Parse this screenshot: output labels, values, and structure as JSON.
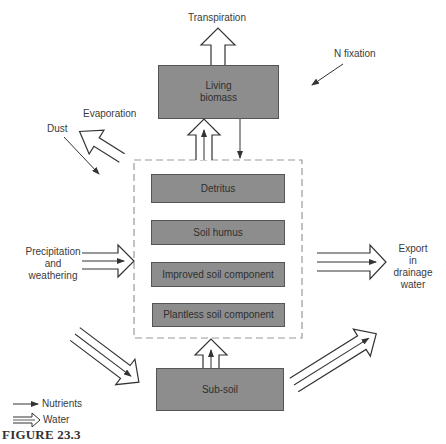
{
  "figure": {
    "caption": "FIGURE 23.3",
    "colors": {
      "box_fill": "#8d8d8d",
      "box_border": "#555555",
      "line": "#333333",
      "dashed_border": "#999999",
      "background": "#ffffff"
    }
  },
  "boxes": {
    "living_biomass": "Living biomass",
    "detritus": "Detritus",
    "soil_humus": "Soil humus",
    "improved_soil": "Improved soil component",
    "plantless_soil": "Plantless soil component",
    "sub_soil": "Sub-soil"
  },
  "labels": {
    "transpiration": "Transpiration",
    "n_fixation": "N fixation",
    "evaporation": "Evaporation",
    "dust": "Dust",
    "precipitation_line1": "Precipitation",
    "precipitation_line2": "and",
    "precipitation_line3": "weathering",
    "export_line1": "Export",
    "export_line2": "in",
    "export_line3": "drainage",
    "export_line4": "water"
  },
  "legend": {
    "nutrients": "Nutrients",
    "water": "Water"
  }
}
